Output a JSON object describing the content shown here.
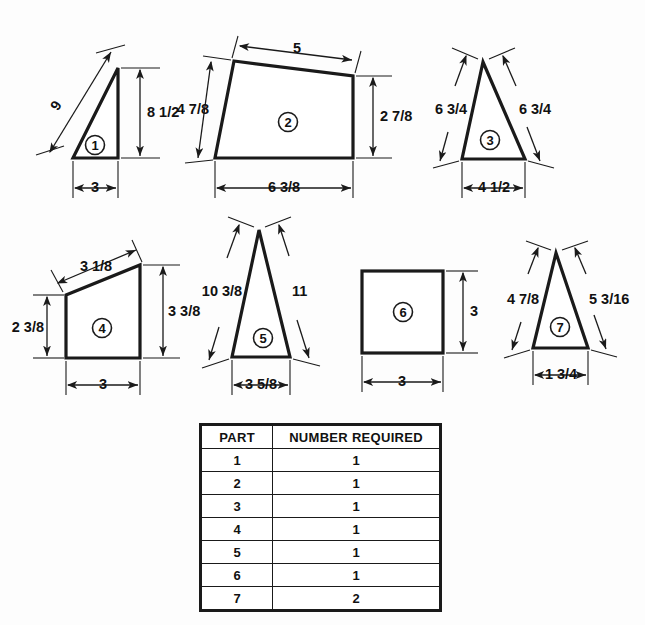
{
  "sheet": {
    "title": "Parts Layout Drawing",
    "background_color": "#fdfdfd",
    "line_color": "#1a1a1a"
  },
  "parts": [
    {
      "id": "1",
      "balloon": "1",
      "shape": "right-triangle",
      "dimensions": [
        {
          "name": "hypotenuse",
          "value": "9"
        },
        {
          "name": "height",
          "value": "8 1/2"
        },
        {
          "name": "base",
          "value": "3"
        }
      ]
    },
    {
      "id": "2",
      "balloon": "2",
      "shape": "quadrilateral",
      "dimensions": [
        {
          "name": "top",
          "value": "5"
        },
        {
          "name": "left-height",
          "value": "4 7/8"
        },
        {
          "name": "right-height",
          "value": "2 7/8"
        },
        {
          "name": "base",
          "value": "6 3/8"
        }
      ]
    },
    {
      "id": "3",
      "balloon": "3",
      "shape": "isosceles-triangle",
      "dimensions": [
        {
          "name": "left-side",
          "value": "6 3/4"
        },
        {
          "name": "right-side",
          "value": "6 3/4"
        },
        {
          "name": "base",
          "value": "4 1/2"
        }
      ]
    },
    {
      "id": "4",
      "balloon": "4",
      "shape": "trapezoid",
      "dimensions": [
        {
          "name": "top",
          "value": "3 1/8"
        },
        {
          "name": "left-height",
          "value": "2 3/8"
        },
        {
          "name": "right-height",
          "value": "3 3/8"
        },
        {
          "name": "base",
          "value": "3"
        }
      ]
    },
    {
      "id": "5",
      "balloon": "5",
      "shape": "tall-triangle",
      "dimensions": [
        {
          "name": "left-side",
          "value": "10 3/8"
        },
        {
          "name": "right-side",
          "value": "11"
        },
        {
          "name": "base",
          "value": "3 5/8"
        }
      ]
    },
    {
      "id": "6",
      "balloon": "6",
      "shape": "square",
      "dimensions": [
        {
          "name": "height",
          "value": "3"
        },
        {
          "name": "base",
          "value": "3"
        }
      ]
    },
    {
      "id": "7",
      "balloon": "7",
      "shape": "tall-triangle",
      "dimensions": [
        {
          "name": "left-side",
          "value": "4 7/8"
        },
        {
          "name": "right-side",
          "value": "5 3/16"
        },
        {
          "name": "base",
          "value": "1 3/4"
        }
      ]
    }
  ],
  "table": {
    "headers": [
      "PART",
      "NUMBER REQUIRED"
    ],
    "rows": [
      {
        "part": "1",
        "qty": "1"
      },
      {
        "part": "2",
        "qty": "1"
      },
      {
        "part": "3",
        "qty": "1"
      },
      {
        "part": "4",
        "qty": "1"
      },
      {
        "part": "5",
        "qty": "1"
      },
      {
        "part": "6",
        "qty": "1"
      },
      {
        "part": "7",
        "qty": "2"
      }
    ]
  }
}
